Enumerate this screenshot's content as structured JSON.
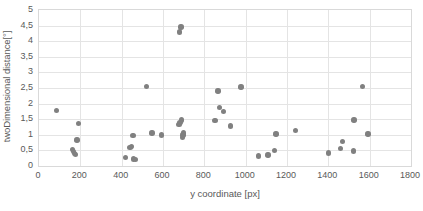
{
  "chart_data": {
    "type": "scatter",
    "title": "",
    "xlabel": "y coordinate [px]",
    "ylabel": "twoDimensional distance[°]",
    "xlim": [
      0,
      1800
    ],
    "ylim": [
      0,
      5
    ],
    "xticks": [
      0,
      200,
      400,
      600,
      800,
      1000,
      1200,
      1400,
      1600,
      1800
    ],
    "xtick_labels": [
      "0",
      "200",
      "400",
      "600",
      "800",
      "1000",
      "1200",
      "1400",
      "1600",
      "1800"
    ],
    "yticks": [
      0,
      0.5,
      1,
      1.5,
      2,
      2.5,
      3,
      3.5,
      4,
      4.5,
      5
    ],
    "ytick_labels": [
      "0",
      "0,5",
      "1",
      "1,5",
      "2",
      "2,5",
      "3",
      "3,5",
      "4",
      "4,5",
      "5"
    ],
    "grid": "horizontal-and-vertical",
    "legend": "none",
    "marker_color": "#808080",
    "grid_color": "#e4e4e4",
    "frame_color": "#d9d9d9",
    "text_color": "#595959",
    "decimal_separator": ",",
    "series": [
      {
        "name": "twoDimensional distance",
        "points": [
          [
            85,
            1.77
          ],
          [
            163,
            0.52
          ],
          [
            166,
            0.47
          ],
          [
            172,
            0.41
          ],
          [
            176,
            0.37
          ],
          [
            183,
            0.83
          ],
          [
            192,
            1.36
          ],
          [
            418,
            0.28
          ],
          [
            440,
            0.6
          ],
          [
            448,
            0.62
          ],
          [
            455,
            0.97
          ],
          [
            458,
            0.22
          ],
          [
            468,
            0.21
          ],
          [
            520,
            2.54
          ],
          [
            547,
            1.06
          ],
          [
            592,
            1.0
          ],
          [
            678,
            1.33
          ],
          [
            680,
            4.29
          ],
          [
            683,
            1.39
          ],
          [
            688,
            4.46
          ],
          [
            690,
            1.47
          ],
          [
            694,
            0.91
          ],
          [
            697,
            1.0
          ],
          [
            700,
            1.06
          ],
          [
            851,
            1.46
          ],
          [
            866,
            2.4
          ],
          [
            874,
            1.88
          ],
          [
            893,
            1.74
          ],
          [
            928,
            1.28
          ],
          [
            978,
            2.53
          ],
          [
            1063,
            0.32
          ],
          [
            1108,
            0.35
          ],
          [
            1140,
            0.5
          ],
          [
            1146,
            1.03
          ],
          [
            1242,
            1.14
          ],
          [
            1401,
            0.42
          ],
          [
            1459,
            0.57
          ],
          [
            1468,
            0.79
          ],
          [
            1521,
            0.48
          ],
          [
            1524,
            1.47
          ],
          [
            1565,
            2.55
          ],
          [
            1592,
            1.02
          ]
        ]
      }
    ]
  }
}
